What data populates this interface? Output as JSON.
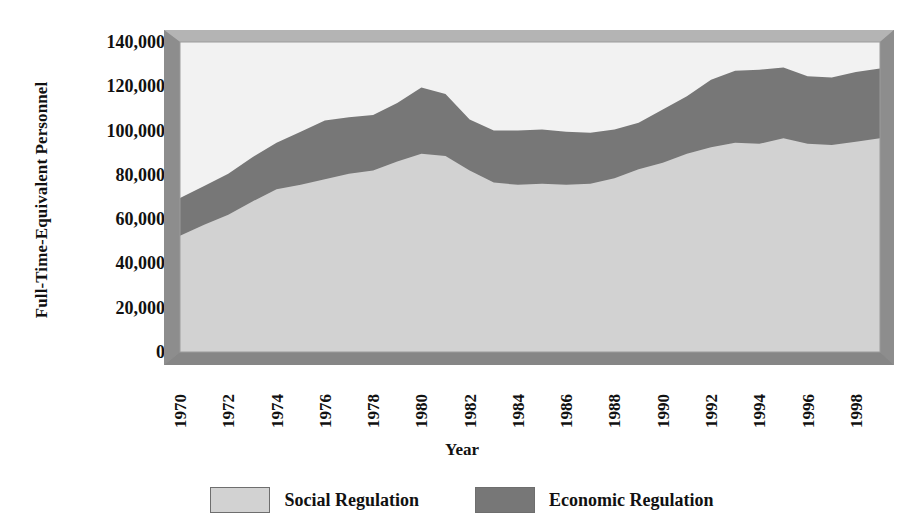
{
  "chart_data": {
    "type": "area",
    "stacked": true,
    "title": "",
    "xlabel": "Year",
    "ylabel": "Full-Time-Equivalent Personnel",
    "x": [
      1970,
      1971,
      1972,
      1973,
      1974,
      1975,
      1976,
      1977,
      1978,
      1979,
      1980,
      1981,
      1982,
      1983,
      1984,
      1985,
      1986,
      1987,
      1988,
      1989,
      1990,
      1991,
      1992,
      1993,
      1994,
      1995,
      1996,
      1997,
      1998,
      1999
    ],
    "xtick_labels": [
      "1970",
      "1972",
      "1974",
      "1976",
      "1978",
      "1980",
      "1982",
      "1984",
      "1986",
      "1988",
      "1990",
      "1992",
      "1994",
      "1996",
      "1998"
    ],
    "ytick_labels": [
      "140,000",
      "120,000",
      "100,000",
      "80,000",
      "60,000",
      "40,000",
      "20,000",
      "0"
    ],
    "ylim": [
      0,
      140000
    ],
    "xlim": [
      1970,
      1999
    ],
    "grid": false,
    "legend_position": "bottom",
    "series": [
      {
        "name": "Social Regulation",
        "color": "#d2d2d2",
        "values": [
          52500,
          57500,
          62000,
          68000,
          73500,
          75500,
          78000,
          80500,
          82000,
          86000,
          89500,
          88500,
          82000,
          76500,
          75500,
          76000,
          75500,
          76000,
          78500,
          82500,
          85500,
          89500,
          92500,
          94500,
          94000,
          96500,
          94000,
          93500,
          95000,
          96500
        ]
      },
      {
        "name": "Economic Regulation",
        "color": "#777777",
        "values": [
          17000,
          17500,
          18500,
          20000,
          21000,
          24000,
          26500,
          25500,
          25000,
          26500,
          30000,
          28000,
          23000,
          23500,
          24500,
          24500,
          24000,
          23000,
          22000,
          21000,
          24000,
          26000,
          30500,
          32500,
          33500,
          32000,
          30500,
          30500,
          31500,
          31500
        ]
      }
    ],
    "totals": [
      69500,
      75000,
      80500,
      88000,
      94500,
      99500,
      104500,
      106000,
      107000,
      112500,
      119500,
      116500,
      105000,
      100000,
      100000,
      100500,
      99500,
      99000,
      100500,
      103500,
      109500,
      115500,
      123000,
      127000,
      127500,
      128500,
      124500,
      124000,
      126500,
      128000
    ]
  },
  "legend": {
    "entries": [
      {
        "label": "Social Regulation",
        "swatch": "#d2d2d2"
      },
      {
        "label": "Economic Regulation",
        "swatch": "#777777"
      }
    ]
  },
  "axes": {
    "y_title": "Full-Time-Equivalent Personnel",
    "x_title": "Year"
  },
  "style": {
    "frame_face": "#a0a0a0",
    "frame_shadow": "#8a8a8a",
    "plot_background": "#f2f2f2",
    "social_color": "#d2d2d2",
    "economic_color": "#777777"
  }
}
